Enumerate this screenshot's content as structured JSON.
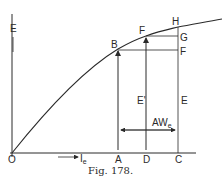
{
  "figure": {
    "caption": "Fig. 178.",
    "y_axis_label": "E",
    "x_axis_label": "I",
    "x_axis_label_sub": "e",
    "origin_label": "O",
    "points": {
      "B": "B",
      "F_curve": "F",
      "H": "H",
      "G": "G",
      "F_right": "F",
      "A": "A",
      "D": "D",
      "C": "C"
    },
    "segment_labels": {
      "E_prime": "E'",
      "E": "E",
      "AW": "AW",
      "AW_sub": "e"
    },
    "colors": {
      "line": "#2a2a2a",
      "background": "#ffffff"
    }
  }
}
